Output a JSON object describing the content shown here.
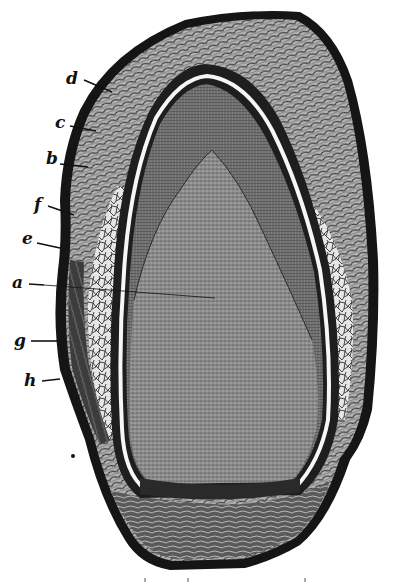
{
  "figure": {
    "type": "labeled cross-section engraving",
    "style": "monochrome wood engraving",
    "colors": {
      "background": "#ffffff",
      "ink": "#111111",
      "outer_coat": "#4a4a4a",
      "fibrous_layer": "#9a9a9a",
      "cellular_tissue": "#e2e2e2",
      "inner_body": "#8c8c8c",
      "apex_region": "#7a7a7a",
      "membrane_line": "#f4f4f4"
    },
    "labels": [
      {
        "id": "d",
        "text": "d"
      },
      {
        "id": "c",
        "text": "c"
      },
      {
        "id": "b",
        "text": "b"
      },
      {
        "id": "f",
        "text": "f"
      },
      {
        "id": "e",
        "text": "e"
      },
      {
        "id": "a",
        "text": "a"
      },
      {
        "id": "g",
        "text": "g"
      },
      {
        "id": "h",
        "text": "h"
      }
    ]
  }
}
